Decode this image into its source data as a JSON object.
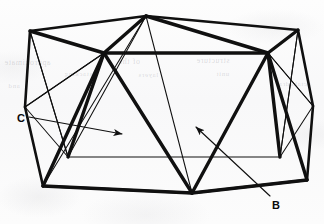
{
  "figure": {
    "type": "line-drawing",
    "width": 324,
    "height": 224,
    "background_color": "#fbfbfb",
    "ink_color": "#101010",
    "heavy_stroke_width": 3.2,
    "medium_stroke_width": 1.9,
    "thin_stroke_width": 1.0
  },
  "labels": [
    {
      "id": "C",
      "text": "C",
      "x": 17,
      "y": 113
    },
    {
      "id": "B",
      "text": "B",
      "x": 272,
      "y": 200
    }
  ],
  "leaders": [
    {
      "id": "leader-c",
      "label": "C",
      "from_x": 29,
      "from_y": 117,
      "to_x": 122,
      "to_y": 134,
      "arrow_at": "end"
    },
    {
      "id": "leader-b",
      "label": "B",
      "from_x": 270,
      "from_y": 196,
      "to_x": 196,
      "to_y": 127,
      "arrow_at": "end"
    }
  ],
  "ghost_text": [
    {
      "text": "approximate",
      "x": 4,
      "y": 58,
      "size": 8
    },
    {
      "text": "of the",
      "x": 118,
      "y": 57,
      "size": 8
    },
    {
      "text": "structure",
      "x": 196,
      "y": 56,
      "size": 8
    },
    {
      "text": "stacking",
      "x": 64,
      "y": 70,
      "size": 7
    },
    {
      "text": "layers",
      "x": 138,
      "y": 71,
      "size": 7
    },
    {
      "text": "unit",
      "x": 216,
      "y": 70,
      "size": 7
    },
    {
      "text": "and",
      "x": 8,
      "y": 82,
      "size": 7
    },
    {
      "text": "octahedral",
      "x": 276,
      "y": 80,
      "size": 7
    }
  ],
  "outer_vertices": [
    {
      "id": "top-left",
      "x": 30,
      "y": 31
    },
    {
      "id": "top-apex",
      "x": 146,
      "y": 16
    },
    {
      "id": "top-right",
      "x": 298,
      "y": 30
    },
    {
      "id": "right-upper",
      "x": 313,
      "y": 106
    },
    {
      "id": "bottom-right",
      "x": 307,
      "y": 180
    },
    {
      "id": "bottom-mid",
      "x": 192,
      "y": 193
    },
    {
      "id": "bottom-left",
      "x": 43,
      "y": 186
    },
    {
      "id": "left-upper",
      "x": 25,
      "y": 107
    }
  ],
  "inner_vertices": [
    {
      "id": "inner-top-left",
      "x": 104,
      "y": 53
    },
    {
      "id": "inner-top-right",
      "x": 268,
      "y": 53
    },
    {
      "id": "inner-bottom-left",
      "x": 68,
      "y": 157
    },
    {
      "id": "inner-bottom-right",
      "x": 280,
      "y": 157
    }
  ],
  "chart_data": {
    "type": "diagram",
    "title": "",
    "annotations": [
      "C",
      "B"
    ]
  }
}
